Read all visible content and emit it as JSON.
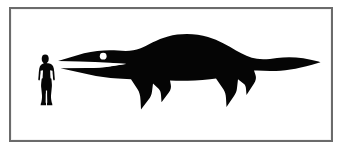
{
  "diagram": {
    "kind": "size-comparison-silhouette",
    "title": "Size comparison scale diagram",
    "background_color": "#ffffff",
    "frame": {
      "border_color": "#6b6b6b",
      "border_width_px": 2,
      "fill_color": "#ffffff",
      "left_px": 9,
      "top_px": 7,
      "width_px": 324,
      "height_px": 135
    },
    "silhouette_color": "#050505",
    "eye_color": "#ffffff",
    "subjects": [
      {
        "name": "human-scale-figure",
        "label": "",
        "description": "Standing human silhouette, arms akimbo with hands on hips, facing right",
        "height_px": 52,
        "left_px": 36,
        "top_px": 54,
        "width_px": 20
      },
      {
        "name": "marine-reptile-figure",
        "label": "",
        "description": "Ichthyosaur-like marine reptile silhouette in left-facing profile with long pointed snout, open jaws, white eye, humped dorsal back, two pointed front flippers, two pointed rear flippers and a long tapering tail",
        "length_px": 262,
        "left_px": 58,
        "top_px": 34,
        "width_px": 262,
        "height_px": 84
      }
    ],
    "captions": []
  }
}
